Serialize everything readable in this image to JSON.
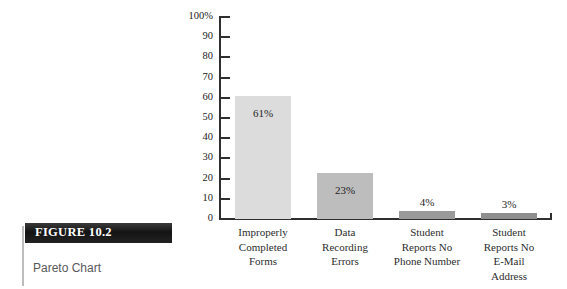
{
  "figure": {
    "number_label": "FIGURE 10.2",
    "title_label": "Pareto Chart"
  },
  "chart_data": {
    "type": "bar",
    "title": "",
    "subtitle": "",
    "xlabel": "",
    "ylabel": "",
    "ylim": [
      0,
      100
    ],
    "grid": false,
    "legend": null,
    "categories": [
      "Improperly\nCompleted\nForms",
      "Data\nRecording\nErrors",
      "Student\nReports No\nPhone Number",
      "Student\nReports No\nE-Mail\nAddress"
    ],
    "category_lines": [
      [
        "Improperly",
        "Completed",
        "Forms"
      ],
      [
        "Data",
        "Recording",
        "Errors"
      ],
      [
        "Student",
        "Reports No",
        "Phone Number"
      ],
      [
        "Student",
        "Reports No",
        "E-Mail",
        "Address"
      ]
    ],
    "values": [
      61,
      23,
      4,
      3
    ],
    "value_labels": [
      "61%",
      "23%",
      "4%",
      "3%"
    ],
    "bar_colors": [
      "#dcdcdc",
      "#bdbdbd",
      "#9a9a9a",
      "#8e8e8e"
    ],
    "y_ticks": [
      100,
      90,
      80,
      70,
      60,
      50,
      40,
      30,
      20,
      10,
      0
    ],
    "y_tick_labels": [
      "100%",
      "90",
      "80",
      "70",
      "60",
      "50",
      "40",
      "30",
      "20",
      "10",
      "0"
    ],
    "axis_color": "#2f2f2f"
  }
}
